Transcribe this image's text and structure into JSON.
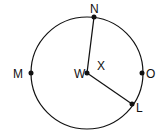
{
  "diagram": {
    "type": "circle-geometry",
    "center": {
      "label": "W",
      "x": 87,
      "y": 73
    },
    "radius": 56,
    "points": [
      {
        "label": "N",
        "x": 94,
        "y": 17,
        "label_x": 90,
        "label_y": 13
      },
      {
        "label": "M",
        "x": 31,
        "y": 73,
        "label_x": 14,
        "label_y": 78
      },
      {
        "label": "O",
        "x": 142,
        "y": 73,
        "label_x": 147,
        "label_y": 78
      },
      {
        "label": "L",
        "x": 132,
        "y": 104,
        "label_x": 137,
        "label_y": 113
      }
    ],
    "angle_label": {
      "text": "X",
      "x": 97,
      "y": 70
    },
    "radii": [
      "WN",
      "WL"
    ],
    "stroke_color": "#111111"
  },
  "labels": {
    "N": "N",
    "M": "M",
    "W": "W",
    "O": "O",
    "L": "L",
    "X": "X"
  }
}
